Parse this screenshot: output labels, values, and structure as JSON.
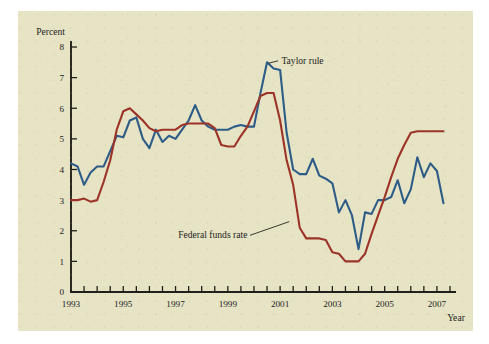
{
  "figure": {
    "background_color": "#e7e4c5",
    "page_color": "#ffffff"
  },
  "axes": {
    "y_axis_title": "Percent",
    "x_axis_title": "Year",
    "y_ticks": [
      "0",
      "1",
      "2",
      "3",
      "4",
      "5",
      "6",
      "7",
      "8"
    ],
    "x_ticks": [
      "1993",
      "1995",
      "1997",
      "1999",
      "2001",
      "2003",
      "2005",
      "2007"
    ]
  },
  "annotations": [
    {
      "name": "taylor-rule-label",
      "text": "Taylor rule"
    },
    {
      "name": "federal-funds-rate-label",
      "text": "Federal funds rate"
    }
  ],
  "chart_data": {
    "type": "line",
    "title": "",
    "xlabel": "Year",
    "ylabel": "Percent",
    "xlim": [
      1993,
      2007.5
    ],
    "ylim": [
      0,
      8
    ],
    "grid": false,
    "legend": "annotated-inline",
    "x_tick_interval_years": 0.5,
    "series": [
      {
        "name": "Taylor rule",
        "color": "#2d5c86",
        "x": [
          1993.0,
          1993.25,
          1993.5,
          1993.75,
          1994.0,
          1994.25,
          1994.5,
          1994.75,
          1995.0,
          1995.25,
          1995.5,
          1995.75,
          1996.0,
          1996.25,
          1996.5,
          1996.75,
          1997.0,
          1997.25,
          1997.5,
          1997.75,
          1998.0,
          1998.25,
          1998.5,
          1998.75,
          1999.0,
          1999.25,
          1999.5,
          1999.75,
          2000.0,
          2000.25,
          2000.5,
          2000.75,
          2001.0,
          2001.25,
          2001.5,
          2001.75,
          2002.0,
          2002.25,
          2002.5,
          2002.75,
          2003.0,
          2003.25,
          2003.5,
          2003.75,
          2004.0,
          2004.25,
          2004.5,
          2004.75,
          2005.0,
          2005.25,
          2005.5,
          2005.75,
          2006.0,
          2006.25,
          2006.5,
          2006.75,
          2007.0,
          2007.25
        ],
        "y": [
          4.2,
          4.1,
          3.5,
          3.9,
          4.1,
          4.1,
          4.6,
          5.1,
          5.05,
          5.6,
          5.7,
          5.0,
          4.7,
          5.3,
          4.9,
          5.1,
          5.0,
          5.3,
          5.6,
          6.1,
          5.6,
          5.4,
          5.3,
          5.3,
          5.3,
          5.4,
          5.45,
          5.4,
          5.4,
          6.5,
          7.5,
          7.3,
          7.25,
          5.2,
          4.0,
          3.85,
          3.85,
          4.35,
          3.8,
          3.7,
          3.55,
          2.6,
          3.0,
          2.5,
          1.4,
          2.6,
          2.55,
          3.0,
          3.0,
          3.1,
          3.65,
          2.9,
          3.35,
          4.4,
          3.75,
          4.2,
          3.95,
          2.9
        ]
      },
      {
        "name": "Federal funds rate",
        "color": "#9c3327",
        "x": [
          1993.0,
          1993.25,
          1993.5,
          1993.75,
          1994.0,
          1994.25,
          1994.5,
          1994.75,
          1995.0,
          1995.25,
          1995.5,
          1995.75,
          1996.0,
          1996.25,
          1996.5,
          1996.75,
          1997.0,
          1997.25,
          1997.5,
          1997.75,
          1998.0,
          1998.25,
          1998.5,
          1998.75,
          1999.0,
          1999.25,
          1999.5,
          1999.75,
          2000.0,
          2000.25,
          2000.5,
          2000.75,
          2001.0,
          2001.25,
          2001.5,
          2001.75,
          2002.0,
          2002.25,
          2002.5,
          2002.75,
          2003.0,
          2003.25,
          2003.5,
          2003.75,
          2004.0,
          2004.25,
          2004.5,
          2004.75,
          2005.0,
          2005.25,
          2005.5,
          2005.75,
          2006.0,
          2006.25,
          2006.5,
          2006.75,
          2007.0,
          2007.25
        ],
        "y": [
          3.0,
          3.0,
          3.05,
          2.95,
          3.0,
          3.6,
          4.3,
          5.3,
          5.9,
          6.0,
          5.8,
          5.6,
          5.35,
          5.25,
          5.3,
          5.3,
          5.3,
          5.45,
          5.5,
          5.5,
          5.5,
          5.5,
          5.35,
          4.8,
          4.75,
          4.75,
          5.1,
          5.4,
          5.9,
          6.4,
          6.5,
          6.5,
          5.6,
          4.3,
          3.5,
          2.1,
          1.75,
          1.75,
          1.75,
          1.7,
          1.3,
          1.25,
          1.0,
          1.0,
          1.0,
          1.25,
          1.9,
          2.5,
          3.1,
          3.75,
          4.35,
          4.8,
          5.2,
          5.25,
          5.25,
          5.25,
          5.25,
          5.25
        ]
      }
    ]
  }
}
